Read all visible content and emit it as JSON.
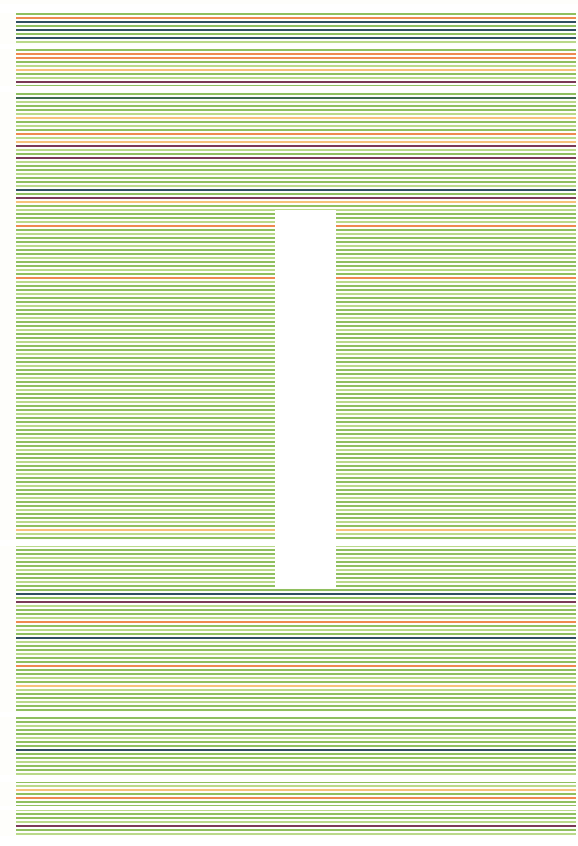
{
  "artwork": {
    "description": "Abstract artwork of horizontal striped lines, mostly green with accent orange, yellow, navy and purple lines, interrupted by a vertical white rectangle",
    "canvas": {
      "width": 578,
      "height": 846,
      "background": "#fefefb"
    },
    "line_x_start": 16,
    "line_x_end": 576,
    "line_spacing": 4,
    "line_thickness": 2,
    "palette": {
      "green": "#8fbf5f",
      "light_green": "#b9d98a",
      "orange": "#ee8a4f",
      "yellow": "#f5c27a",
      "navy": "#2f4f5f",
      "purple": "#7a3a55",
      "dark_green": "#3f6a4f"
    },
    "white_rectangle": {
      "x": 275,
      "y": 210,
      "width": 61,
      "height": 378,
      "color": "#ffffff"
    },
    "white_bands": [
      {
        "y": 4,
        "height": 9
      },
      {
        "y": 44,
        "height": 5
      },
      {
        "y": 86,
        "height": 6
      },
      {
        "y": 540,
        "height": 6
      },
      {
        "y": 712,
        "height": 5
      },
      {
        "y": 775,
        "height": 7
      },
      {
        "y": 806,
        "height": 4
      },
      {
        "y": 836,
        "height": 10
      }
    ],
    "accent_lines": [
      {
        "y": 15,
        "color": "orange"
      },
      {
        "y": 19,
        "color": "navy"
      },
      {
        "y": 27,
        "color": "navy"
      },
      {
        "y": 36,
        "color": "navy"
      },
      {
        "y": 52,
        "color": "orange"
      },
      {
        "y": 56,
        "color": "orange"
      },
      {
        "y": 68,
        "color": "yellow"
      },
      {
        "y": 81,
        "color": "purple"
      },
      {
        "y": 94,
        "color": "navy"
      },
      {
        "y": 95,
        "color": "dark_green"
      },
      {
        "y": 115,
        "color": "yellow"
      },
      {
        "y": 132,
        "color": "orange"
      },
      {
        "y": 140,
        "color": "yellow"
      },
      {
        "y": 144,
        "color": "purple"
      },
      {
        "y": 157,
        "color": "purple"
      },
      {
        "y": 186,
        "color": "navy"
      },
      {
        "y": 194,
        "color": "purple"
      },
      {
        "y": 198,
        "color": "yellow"
      },
      {
        "y": 223,
        "color": "orange"
      },
      {
        "y": 277,
        "color": "orange"
      },
      {
        "y": 527,
        "color": "yellow"
      },
      {
        "y": 593,
        "color": "navy"
      },
      {
        "y": 601,
        "color": "purple"
      },
      {
        "y": 618,
        "color": "orange"
      },
      {
        "y": 635,
        "color": "navy"
      },
      {
        "y": 665,
        "color": "orange"
      },
      {
        "y": 682,
        "color": "yellow"
      },
      {
        "y": 748,
        "color": "navy"
      },
      {
        "y": 788,
        "color": "yellow"
      },
      {
        "y": 797,
        "color": "orange"
      },
      {
        "y": 822,
        "color": "purple"
      }
    ]
  }
}
